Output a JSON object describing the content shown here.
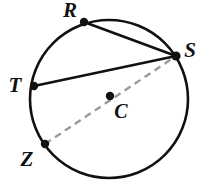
{
  "figure": {
    "background_color": "#ffffff",
    "stroke_color": "#111111",
    "dashed_stroke_color": "#9a9a9a",
    "circle": {
      "center_x": 109,
      "center_y": 99,
      "radius": 79,
      "stroke_width": 2.6
    },
    "center_point": {
      "label": "C",
      "x": 110,
      "y": 96,
      "dot_radius": 4.2,
      "label_x": 115,
      "label_y": 118
    },
    "points": [
      {
        "id": "R",
        "label": "R",
        "x": 84,
        "y": 22,
        "dot_radius": 4.2,
        "label_x": 70,
        "label_y": 17
      },
      {
        "id": "S",
        "label": "S",
        "x": 176,
        "y": 56,
        "dot_radius": 4.6,
        "label_x": 186,
        "label_y": 57
      },
      {
        "id": "T",
        "label": "T",
        "x": 34,
        "y": 86,
        "dot_radius": 4.2,
        "label_x": 12,
        "label_y": 92
      },
      {
        "id": "Z",
        "label": "Z",
        "x": 45,
        "y": 144,
        "dot_radius": 4.2,
        "label_x": 24,
        "label_y": 166
      }
    ],
    "segments": [
      {
        "id": "RS",
        "from": "R",
        "to": "S",
        "style": "solid",
        "stroke_width": 2.6,
        "color": "#111111"
      },
      {
        "id": "TS",
        "from": "T",
        "to": "S",
        "style": "solid",
        "stroke_width": 2.6,
        "color": "#111111"
      },
      {
        "id": "ZS",
        "from": "Z",
        "to": "S",
        "style": "dashed",
        "stroke_width": 2.4,
        "color": "#9a9a9a",
        "dash_pattern": "7,5",
        "note": "diameter through center C"
      }
    ]
  }
}
